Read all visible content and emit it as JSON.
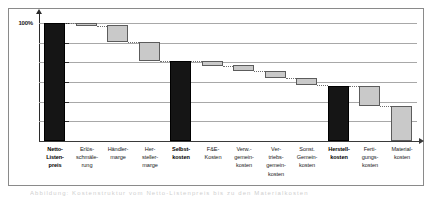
{
  "figure": {
    "axis": {
      "value_axis_label": "100%",
      "value_axis_max_percent": 100,
      "tick_count": 7,
      "gridlines_visible": true,
      "value_arrow_icon": "up-arrow-icon",
      "category_arrow_icon": "right-arrow-icon"
    },
    "caption_faint": "Abbildung: Kostenstruktur vom Netto-Listenpreis bis zu den Materialkosten"
  },
  "chart_data": {
    "type": "bar",
    "title": "",
    "subtitle": "",
    "xlabel": "",
    "ylabel": "100%",
    "ylim": [
      0,
      100
    ],
    "grid": true,
    "legend_position": "none",
    "annotations": [
      "Netto-Listenpreis = 100%",
      "Selbstkosten und Herstellkosten sind Zwischensummen (schwarz)",
      "Abzugsposten sind grau dargestellt"
    ],
    "tick_labels": [
      "100%"
    ],
    "categories": [
      "Netto-Listenpreis",
      "Erlösschmälerung",
      "Händlermarge",
      "Herstellermarge",
      "Selbstkosten",
      "F&E-Kosten",
      "Verw.-gemeinkosten",
      "Vertriebsgemeinkosten",
      "Sonst. Gemeinkosten",
      "Herstellkosten",
      "Fertigungskosten",
      "Materialkosten"
    ],
    "bar_kinds": [
      "total",
      "delta",
      "delta",
      "delta",
      "total",
      "delta",
      "delta",
      "delta",
      "delta",
      "total",
      "delta",
      "delta"
    ],
    "values": [
      100,
      2,
      14,
      16,
      68,
      4,
      5,
      6,
      6,
      47,
      17,
      30
    ],
    "bar_tops": [
      100,
      100,
      98,
      84,
      68,
      68,
      64,
      59,
      53,
      47,
      47,
      30
    ],
    "bar_bottoms": [
      0,
      98,
      84,
      68,
      0,
      64,
      59,
      53,
      47,
      0,
      30,
      0
    ],
    "series": [
      {
        "name": "Kostenbausteine (% vom Netto-Listenpreis)",
        "values": [
          100,
          2,
          14,
          16,
          68,
          4,
          5,
          6,
          6,
          47,
          17,
          30
        ]
      }
    ]
  },
  "labels": [
    {
      "lines": [
        "Netto-",
        "Listen-",
        "preis"
      ],
      "strong": true
    },
    {
      "lines": [
        "Erlös-",
        "schmäle-",
        "rung"
      ],
      "strong": false
    },
    {
      "lines": [
        "Händler-",
        "marge"
      ],
      "strong": false
    },
    {
      "lines": [
        "Her-",
        "steller-",
        "marge"
      ],
      "strong": false
    },
    {
      "lines": [
        "Selbst-",
        "kosten"
      ],
      "strong": true
    },
    {
      "lines": [
        "F&E-",
        "Kosten"
      ],
      "strong": false
    },
    {
      "lines": [
        "Verw.-",
        "gemein-",
        "kosten"
      ],
      "strong": false
    },
    {
      "lines": [
        "Ver-",
        "triebs-",
        "gemein-",
        "kosten"
      ],
      "strong": false
    },
    {
      "lines": [
        "Sonst.",
        "Gemein-",
        "kosten"
      ],
      "strong": false
    },
    {
      "lines": [
        "Herstell-",
        "kosten"
      ],
      "strong": true
    },
    {
      "lines": [
        "Ferti-",
        "gungs-",
        "kosten"
      ],
      "strong": false
    },
    {
      "lines": [
        "Material-",
        "kosten"
      ],
      "strong": false
    }
  ],
  "colors": {
    "total_bar": "#151515",
    "delta_bar": "#c9c9c9",
    "delta_bar_border": "#5c5c5c",
    "gridline": "#a8a8a8",
    "axis": "#2b2b2b",
    "frame": "#8a8a8a",
    "connector": "#6d6d6d",
    "background": "#ffffff"
  }
}
